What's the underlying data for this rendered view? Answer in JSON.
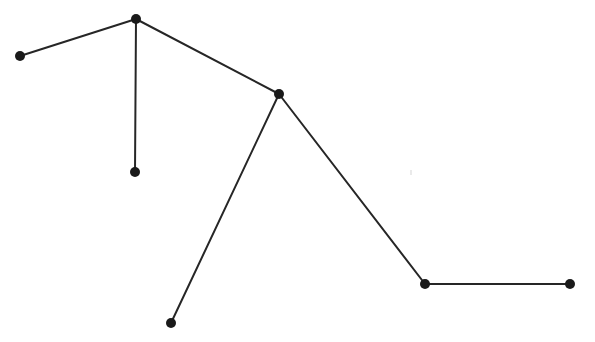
{
  "figure": {
    "title": "",
    "caption": "",
    "background_color": "#ffffff",
    "width": 595,
    "height": 342
  },
  "chart_data": {
    "type": "scatter",
    "title": "",
    "subtitle": "",
    "xlabel": "",
    "ylabel": "",
    "xlim": [
      0,
      595
    ],
    "ylim": [
      0,
      342
    ],
    "grid": false,
    "legend": null,
    "axes_visible": false,
    "tick_labels_x": [],
    "tick_labels_y": [],
    "annotations": [],
    "style": {
      "edge_color": "#262626",
      "edge_width": 2,
      "node_color": "#1a1a1a",
      "node_radius": 5
    },
    "nodes": [
      {
        "id": "A",
        "label": "",
        "x": 20,
        "y": 56
      },
      {
        "id": "B",
        "label": "",
        "x": 136,
        "y": 19
      },
      {
        "id": "C",
        "label": "",
        "x": 135,
        "y": 172
      },
      {
        "id": "D",
        "label": "",
        "x": 279,
        "y": 94
      },
      {
        "id": "E",
        "label": "",
        "x": 171,
        "y": 323
      },
      {
        "id": "F",
        "label": "",
        "x": 425,
        "y": 284
      },
      {
        "id": "G",
        "label": "",
        "x": 570,
        "y": 284
      }
    ],
    "edges": [
      {
        "id": "AB",
        "from": "A",
        "to": "B",
        "x1": 20,
        "y1": 56,
        "x2": 136,
        "y2": 19
      },
      {
        "id": "BC",
        "from": "B",
        "to": "C",
        "x1": 136,
        "y1": 19,
        "x2": 135,
        "y2": 172
      },
      {
        "id": "BD",
        "from": "B",
        "to": "D",
        "x1": 136,
        "y1": 19,
        "x2": 279,
        "y2": 94
      },
      {
        "id": "DE",
        "from": "D",
        "to": "E",
        "x1": 279,
        "y1": 94,
        "x2": 171,
        "y2": 323
      },
      {
        "id": "DF",
        "from": "D",
        "to": "F",
        "x1": 279,
        "y1": 94,
        "x2": 425,
        "y2": 284
      },
      {
        "id": "FG",
        "from": "F",
        "to": "G",
        "x1": 425,
        "y1": 284,
        "x2": 570,
        "y2": 284
      }
    ],
    "artifacts": [
      {
        "id": "speck-1",
        "x": 410,
        "y": 170,
        "w": 2,
        "h": 5,
        "color": "#b9b9b9"
      }
    ]
  }
}
